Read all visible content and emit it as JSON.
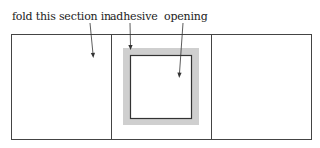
{
  "diagram": {
    "labels": {
      "fold": "fold this section in",
      "adhesive": "adhesive",
      "opening": "opening"
    },
    "panels": [
      {
        "name": "left-panel",
        "role": "fold this section in"
      },
      {
        "name": "center-panel",
        "role": "adhesive with opening"
      },
      {
        "name": "right-panel",
        "role": "right section"
      }
    ],
    "colors": {
      "line": "#333333",
      "adhesive": "#cfcfcf",
      "background": "#ffffff"
    }
  }
}
